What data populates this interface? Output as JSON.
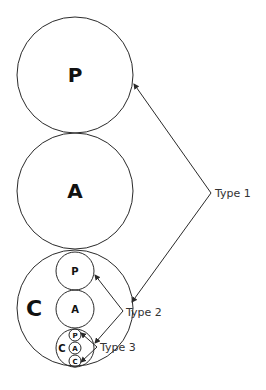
{
  "diagram": {
    "circles": {
      "top_p": "P",
      "top_a": "A",
      "big_c": "C",
      "mid_p": "P",
      "mid_a": "A",
      "small_c": "C",
      "tiny_p": "P",
      "tiny_a": "A",
      "tiny_c": "C"
    },
    "labels": {
      "type1": "Type 1",
      "type2": "Type 2",
      "type3": "Type 3"
    },
    "colors": {
      "stroke": "#2a2a2a",
      "background": "#ffffff"
    }
  }
}
